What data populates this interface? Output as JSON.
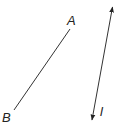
{
  "diagram": {
    "segment": {
      "label_a": "A",
      "label_b": "B",
      "endpoint_a": [
        70,
        29
      ],
      "endpoint_b": [
        14,
        110
      ]
    },
    "line": {
      "label": "l",
      "start": [
        113,
        5
      ],
      "end": [
        92,
        121
      ],
      "arrows": "both"
    },
    "colors": {
      "stroke": "#333333",
      "background": "#ffffff"
    }
  }
}
